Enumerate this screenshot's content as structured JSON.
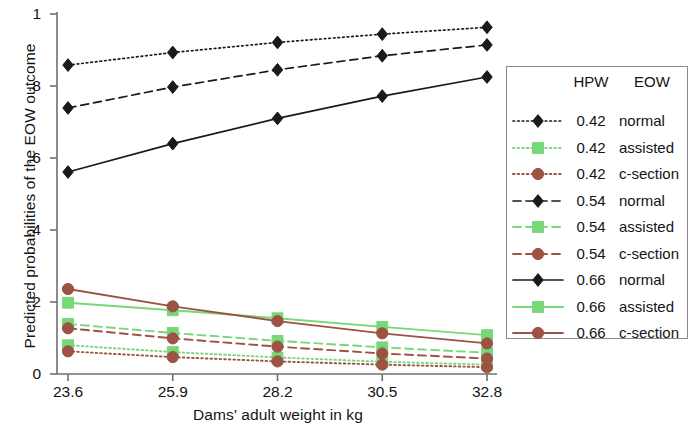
{
  "chart_data": {
    "type": "line",
    "title": "",
    "xlabel": "Dams' adult weight in kg",
    "ylabel": "Predicted probabilities of the EOW outcome",
    "x": [
      23.6,
      25.9,
      28.2,
      30.5,
      32.8
    ],
    "xtick_labels": [
      "23.6",
      "25.9",
      "28.2",
      "30.5",
      "32.8"
    ],
    "ytick_labels": [
      "0",
      ".2",
      ".4",
      ".6",
      ".8",
      "1"
    ],
    "ytick_values": [
      0,
      0.2,
      0.4,
      0.6,
      0.8,
      1
    ],
    "xlim": [
      23.6,
      32.8
    ],
    "ylim": [
      0,
      1
    ],
    "grid": false,
    "legend_position": "right",
    "series": [
      {
        "name": "0.42 normal",
        "hpw": "0.42",
        "eow": "normal",
        "color": "#1a1a1a",
        "marker": "diamond",
        "linestyle": "dotted",
        "values": [
          0.858,
          0.893,
          0.921,
          0.944,
          0.963
        ]
      },
      {
        "name": "0.42 assisted",
        "hpw": "0.42",
        "eow": "assisted",
        "color": "#77d877",
        "marker": "square",
        "linestyle": "dotted",
        "values": [
          0.08,
          0.061,
          0.046,
          0.034,
          0.026
        ]
      },
      {
        "name": "0.42 c-section",
        "hpw": "0.42",
        "eow": "c-section",
        "color": "#9c5344",
        "marker": "circle",
        "linestyle": "dotted",
        "values": [
          0.063,
          0.047,
          0.035,
          0.026,
          0.019
        ]
      },
      {
        "name": "0.54 normal",
        "hpw": "0.54",
        "eow": "normal",
        "color": "#1a1a1a",
        "marker": "diamond",
        "linestyle": "dashed",
        "values": [
          0.739,
          0.797,
          0.845,
          0.884,
          0.914
        ]
      },
      {
        "name": "0.54 assisted",
        "hpw": "0.54",
        "eow": "assisted",
        "color": "#77d877",
        "marker": "square",
        "linestyle": "dashed",
        "values": [
          0.139,
          0.114,
          0.092,
          0.074,
          0.059
        ]
      },
      {
        "name": "0.54 c-section",
        "hpw": "0.54",
        "eow": "c-section",
        "color": "#9c5344",
        "marker": "circle",
        "linestyle": "dashed",
        "values": [
          0.127,
          0.099,
          0.076,
          0.057,
          0.043
        ]
      },
      {
        "name": "0.66 normal",
        "hpw": "0.66",
        "eow": "normal",
        "color": "#1a1a1a",
        "marker": "diamond",
        "linestyle": "solid",
        "values": [
          0.561,
          0.64,
          0.71,
          0.772,
          0.825
        ]
      },
      {
        "name": "0.66 assisted",
        "hpw": "0.66",
        "eow": "assisted",
        "color": "#77d877",
        "marker": "square",
        "linestyle": "solid",
        "values": [
          0.198,
          0.177,
          0.155,
          0.131,
          0.108
        ]
      },
      {
        "name": "0.66 c-section",
        "hpw": "0.66",
        "eow": "c-section",
        "color": "#9c5344",
        "marker": "circle",
        "linestyle": "solid",
        "values": [
          0.236,
          0.188,
          0.147,
          0.113,
          0.085
        ]
      }
    ]
  },
  "legend": {
    "header_hpw": "HPW",
    "header_eow": "EOW",
    "rows": [
      {
        "hpw": "0.42",
        "eow": "normal"
      },
      {
        "hpw": "0.42",
        "eow": "assisted"
      },
      {
        "hpw": "0.42",
        "eow": "c-section"
      },
      {
        "hpw": "0.54",
        "eow": "normal"
      },
      {
        "hpw": "0.54",
        "eow": "assisted"
      },
      {
        "hpw": "0.54",
        "eow": "c-section"
      },
      {
        "hpw": "0.66",
        "eow": "normal"
      },
      {
        "hpw": "0.66",
        "eow": "assisted"
      },
      {
        "hpw": "0.66",
        "eow": "c-section"
      }
    ]
  }
}
